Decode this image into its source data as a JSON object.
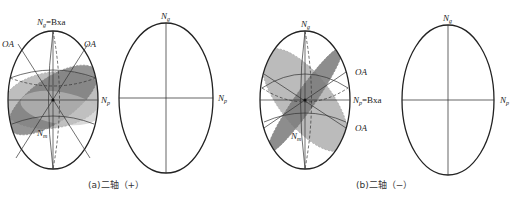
{
  "figures": [
    {
      "id": "a",
      "caption": "(a)二轴（+）",
      "labels": {
        "ng": "N",
        "ng_sub": "g",
        "ng_suffix": "=Bxa",
        "np": "N",
        "np_sub": "p",
        "nm": "N",
        "nm_sub": "m",
        "oa_left": "OA",
        "oa_right": "OA"
      },
      "blank_labels": {
        "ng": "N",
        "ng_sub": "g",
        "np": "N",
        "np_sub": "p"
      }
    },
    {
      "id": "b",
      "caption": "(b)二轴（−）",
      "labels": {
        "ng": "N",
        "ng_sub": "g",
        "np": "N",
        "np_sub": "p",
        "np_suffix": "=Bxa",
        "nm": "N",
        "nm_sub": "m",
        "oa_upper": "OA",
        "oa_lower": "OA"
      },
      "blank_labels": {
        "ng": "N",
        "ng_sub": "g",
        "np": "N",
        "np_sub": "p"
      }
    }
  ],
  "colors": {
    "outline": "#222222",
    "plane_light": "#b4b4b4",
    "plane_dark": "#7a7a7a",
    "grid": "#555555"
  }
}
